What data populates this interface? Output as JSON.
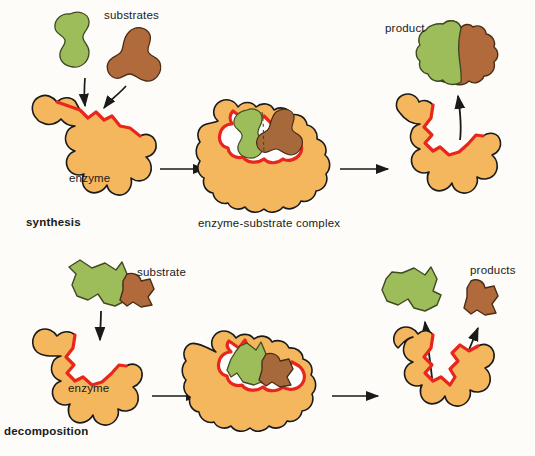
{
  "figure": {
    "background_color": "#fdfcf8",
    "colors": {
      "enzyme_fill": "#f5b75e",
      "enzyme_outline": "#1a1a1a",
      "active_site_red": "#e8261c",
      "substrate_green": "#9cbd5a",
      "substrate_brown": "#b06a3b",
      "arrow_color": "#1a1a1a",
      "text_color": "#1a1a1a"
    }
  },
  "rows": [
    {
      "id": "synthesis-row",
      "row_label": "synthesis",
      "row_label_bold": true,
      "stages": [
        {
          "id": "synthesis-stage-1",
          "enzyme_label": "enzyme",
          "reactant_label": "substrates",
          "reactant_count": 2,
          "arrows_in": 2
        },
        {
          "id": "synthesis-stage-2",
          "stage_label": "enzyme-substrate complex",
          "bound_substrates": 2
        },
        {
          "id": "synthesis-stage-3",
          "product_label": "product",
          "product_count": 1,
          "arrows_out": 1
        }
      ]
    },
    {
      "id": "decomposition-row",
      "row_label": "decomposition",
      "row_label_bold": true,
      "stages": [
        {
          "id": "decomposition-stage-1",
          "enzyme_label": "enzyme",
          "reactant_label": "substrate",
          "reactant_count": 1,
          "arrows_in": 1
        },
        {
          "id": "decomposition-stage-2",
          "stage_label": "",
          "bound_substrates": 1
        },
        {
          "id": "decomposition-stage-3",
          "product_label": "products",
          "product_count": 2,
          "arrows_out": 2
        }
      ]
    }
  ],
  "labels": {
    "substrates": "substrates",
    "substrate": "substrate",
    "enzyme_top": "enzyme",
    "enzyme_bottom": "enzyme",
    "synthesis": "synthesis",
    "decomposition": "decomposition",
    "enzyme_substrate_complex": "enzyme-substrate complex",
    "product": "product",
    "products": "products"
  }
}
